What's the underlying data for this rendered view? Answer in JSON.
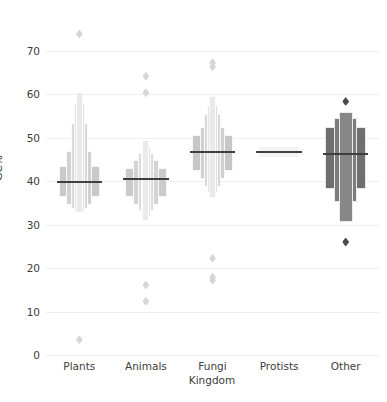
{
  "chart_data": {
    "type": "box",
    "variant": "letter-value-plot",
    "title": "",
    "xlabel": "Kingdom",
    "ylabel": "GC%",
    "categories": [
      "Plants",
      "Animals",
      "Fungi",
      "Protists",
      "Other"
    ],
    "ylim": [
      0,
      76
    ],
    "yticks": [
      0,
      10,
      20,
      30,
      40,
      50,
      60,
      70
    ],
    "ytick_labels": [
      "0",
      "10",
      "20",
      "30",
      "40",
      "50",
      "60",
      "70"
    ],
    "grid": "horizontal",
    "legend": "none",
    "palette": [
      "#cccccc",
      "#cecece",
      "#c3c3c3",
      "#f2f2f2",
      "#6e6e6e"
    ],
    "series": [
      {
        "name": "Plants",
        "median": 39.8,
        "boxes": [
          {
            "low": 36.5,
            "high": 43.6,
            "width": 1.0,
            "shade": "#c9c9c9"
          },
          {
            "low": 34.6,
            "high": 47.0,
            "width": 0.62,
            "shade": "#d2d2d2"
          },
          {
            "low": 33.6,
            "high": 53.5,
            "width": 0.4,
            "shade": "#dadada"
          },
          {
            "low": 33.0,
            "high": 58.0,
            "width": 0.26,
            "shade": "#e2e2e2"
          },
          {
            "low": 32.6,
            "high": 60.5,
            "width": 0.17,
            "shade": "#e9e9e9"
          }
        ],
        "outliers": [
          73.9,
          3.5
        ]
      },
      {
        "name": "Animals",
        "median": 40.6,
        "boxes": [
          {
            "low": 36.4,
            "high": 43.0,
            "width": 1.0,
            "shade": "#cbcbcb"
          },
          {
            "low": 34.6,
            "high": 44.8,
            "width": 0.62,
            "shade": "#d4d4d4"
          },
          {
            "low": 33.1,
            "high": 46.6,
            "width": 0.4,
            "shade": "#dcdcdc"
          },
          {
            "low": 31.8,
            "high": 48.0,
            "width": 0.26,
            "shade": "#e4e4e4"
          },
          {
            "low": 30.9,
            "high": 49.5,
            "width": 0.17,
            "shade": "#ebebeb"
          }
        ],
        "outliers": [
          64.2,
          60.4,
          16.1,
          12.4
        ]
      },
      {
        "name": "Fungi",
        "median": 46.8,
        "boxes": [
          {
            "low": 42.4,
            "high": 50.6,
            "width": 1.0,
            "shade": "#c6c6c6"
          },
          {
            "low": 40.6,
            "high": 52.6,
            "width": 0.62,
            "shade": "#d0d0d0"
          },
          {
            "low": 38.8,
            "high": 55.4,
            "width": 0.4,
            "shade": "#d9d9d9"
          },
          {
            "low": 37.2,
            "high": 57.6,
            "width": 0.26,
            "shade": "#e1e1e1"
          },
          {
            "low": 36.2,
            "high": 59.6,
            "width": 0.17,
            "shade": "#e9e9e9"
          }
        ],
        "outliers": [
          67.3,
          66.4,
          22.3,
          17.9,
          17.2
        ]
      },
      {
        "name": "Protists",
        "median": 46.8,
        "boxes": [
          {
            "low": 45.4,
            "high": 48.2,
            "width": 1.0,
            "shade": "#f4f4f4"
          }
        ],
        "outliers": []
      },
      {
        "name": "Other",
        "median": 46.2,
        "boxes": [
          {
            "low": 38.2,
            "high": 52.6,
            "width": 1.0,
            "shade": "#6f6f6f"
          },
          {
            "low": 35.2,
            "high": 54.5,
            "width": 0.55,
            "shade": "#7c7c7c"
          },
          {
            "low": 30.6,
            "high": 56.0,
            "width": 0.33,
            "shade": "#878787"
          }
        ],
        "outliers": [
          58.4,
          26.0
        ]
      }
    ]
  }
}
